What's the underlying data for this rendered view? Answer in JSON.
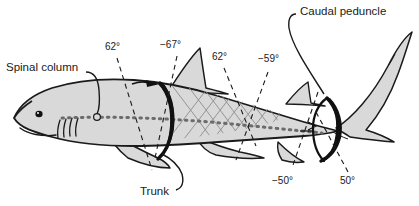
{
  "figure": {
    "background_color": "#ffffff",
    "body_fill": "#d9d9d9",
    "outline_color": "#1a1a1a",
    "band_color": "#111111",
    "mesh_color": "#8a8a8a",
    "spine_color": "#6b6b6b"
  },
  "annotations": [
    {
      "id": "spinal-column",
      "label": "Spinal column"
    },
    {
      "id": "trunk",
      "label": "Trunk"
    },
    {
      "id": "caudal-peduncle",
      "label": "Caudal peduncle"
    }
  ],
  "angles": [
    {
      "id": "angle-1",
      "label": "62°",
      "value": 62
    },
    {
      "id": "angle-2",
      "label": "−67°",
      "value": -67
    },
    {
      "id": "angle-3",
      "label": "62°",
      "value": 62
    },
    {
      "id": "angle-4",
      "label": "−59°",
      "value": -59
    },
    {
      "id": "angle-5",
      "label": "−50°",
      "value": -50
    },
    {
      "id": "angle-6",
      "label": "50°",
      "value": 50
    }
  ]
}
